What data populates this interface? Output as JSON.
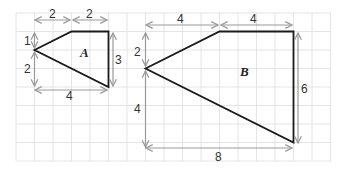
{
  "diagram": {
    "type": "scaled shapes on square grid",
    "grid": {
      "columns": 17,
      "rows": 8,
      "cell_px": 18.5,
      "line_color": "#e4e4e4"
    },
    "shapes": [
      {
        "name": "A",
        "label": "A",
        "vertices_units": [
          [
            1,
            2
          ],
          [
            3,
            1
          ],
          [
            5,
            1
          ],
          [
            5,
            4
          ]
        ],
        "dimensions": {
          "top_left": "2",
          "top_right": "2",
          "left_upper": "1",
          "left_lower": "2",
          "right": "3",
          "bottom": "4"
        }
      },
      {
        "name": "B",
        "label": "B",
        "vertices_units": [
          [
            7,
            3
          ],
          [
            11,
            1
          ],
          [
            15,
            1
          ],
          [
            15,
            7
          ]
        ],
        "dimensions": {
          "top_left": "4",
          "top_right": "4",
          "left_upper": "2",
          "left_lower": "4",
          "right": "6",
          "bottom": "8"
        }
      }
    ],
    "colors": {
      "outline": "#1a1a1a",
      "dimension_arrows": "#9a9a9a",
      "text": "#333333"
    }
  }
}
